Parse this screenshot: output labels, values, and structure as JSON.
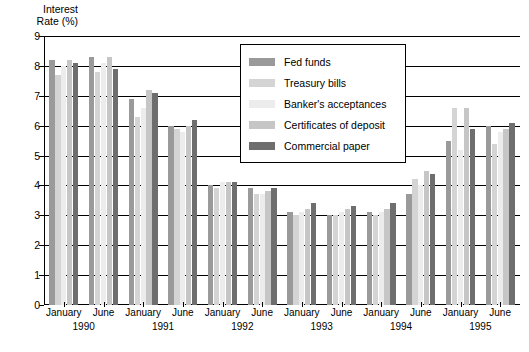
{
  "chart_data": {
    "type": "bar",
    "title": "",
    "xlabel": "",
    "ylabel": "Interest\nRate (%)",
    "ylim": [
      0,
      9
    ],
    "ytick_values": [
      0,
      1,
      2,
      3,
      4,
      5,
      6,
      7,
      8,
      9
    ],
    "ytick_labels": [
      "0",
      "1",
      "2",
      "3",
      "4",
      "5",
      "6",
      "7",
      "8",
      "9"
    ],
    "grid": true,
    "legend_position": "upper-center",
    "categories": [
      "January 1990",
      "June 1990",
      "January 1991",
      "June 1991",
      "January 1992",
      "June 1992",
      "January 1993",
      "June 1993",
      "January 1994",
      "June 1994",
      "January 1995",
      "June 1995"
    ],
    "period_labels": [
      "January",
      "June",
      "January",
      "June",
      "January",
      "June",
      "January",
      "June",
      "January",
      "June",
      "January",
      "June"
    ],
    "year_labels": [
      "1990",
      "1991",
      "1992",
      "1993",
      "1994",
      "1995"
    ],
    "series": [
      {
        "name": "Fed funds",
        "color": "#9a9a9a",
        "values": [
          8.2,
          8.3,
          6.9,
          6.0,
          4.0,
          3.9,
          3.1,
          3.0,
          3.1,
          3.7,
          5.5,
          6.0
        ]
      },
      {
        "name": "Treasury bills",
        "color": "#d4d4d4",
        "values": [
          7.7,
          7.8,
          6.3,
          5.9,
          3.9,
          3.7,
          3.0,
          3.0,
          3.0,
          4.2,
          6.6,
          5.4
        ]
      },
      {
        "name": "Banker's acceptances",
        "color": "#ececec",
        "values": [
          8.0,
          8.1,
          6.6,
          5.8,
          4.1,
          3.7,
          3.1,
          3.1,
          3.1,
          4.0,
          5.2,
          5.8
        ]
      },
      {
        "name": "Certificates of deposit",
        "color": "#c6c6c6",
        "values": [
          8.2,
          8.3,
          7.2,
          6.0,
          4.1,
          3.8,
          3.2,
          3.2,
          3.2,
          4.5,
          6.6,
          5.9
        ]
      },
      {
        "name": "Commercial paper",
        "color": "#6e6e6e",
        "values": [
          8.1,
          7.9,
          7.1,
          6.2,
          4.1,
          3.9,
          3.4,
          3.3,
          3.4,
          4.4,
          5.9,
          6.1
        ]
      }
    ]
  },
  "legend": {
    "entries": [
      {
        "label": "Fed funds",
        "color": "#9a9a9a"
      },
      {
        "label": "Treasury bills",
        "color": "#d4d4d4"
      },
      {
        "label": "Banker's acceptances",
        "color": "#ececec"
      },
      {
        "label": "Certificates of deposit",
        "color": "#c6c6c6"
      },
      {
        "label": "Commercial paper",
        "color": "#6e6e6e"
      }
    ]
  }
}
